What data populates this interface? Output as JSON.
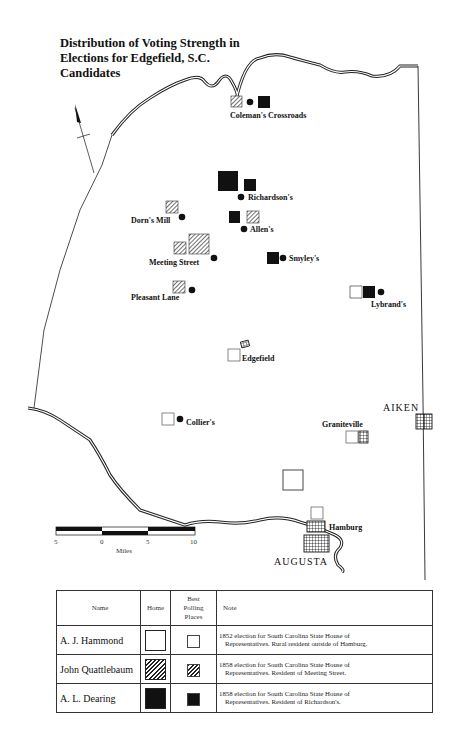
{
  "title": "Distribution of Voting Strength in Elections for Edgefield, S.C. Candidates",
  "title_lines": [
    "Distribution of Voting Strength in",
    "Elections for Edgefield, S.C.",
    "Candidates"
  ],
  "places": [
    {
      "name": "Coleman's Crossroads",
      "markers": [
        "hatch-small",
        "dot",
        "solid-small"
      ]
    },
    {
      "name": "Richardson's",
      "markers": [
        "solid-large",
        "solid-small",
        "dot"
      ]
    },
    {
      "name": "Dorn's Mill",
      "markers": [
        "hatch-small",
        "dot"
      ]
    },
    {
      "name": "Allen's",
      "markers": [
        "solid-small",
        "hatch-small",
        "dot"
      ]
    },
    {
      "name": "Meeting Street",
      "markers": [
        "hatch-small",
        "hatch-large",
        "dot"
      ]
    },
    {
      "name": "Smyley's",
      "markers": [
        "solid-small",
        "dot"
      ]
    },
    {
      "name": "Pleasant Lane",
      "markers": [
        "hatch-small",
        "dot"
      ]
    },
    {
      "name": "Lybrand's",
      "markers": [
        "empty-small",
        "solid-small",
        "dot"
      ]
    },
    {
      "name": "Edgefield",
      "markers": [
        "town-grid",
        "empty-small"
      ]
    },
    {
      "name": "Collier's",
      "markers": [
        "empty-small",
        "dot"
      ]
    },
    {
      "name": "Graniteville",
      "markers": [
        "empty-small",
        "town-grid"
      ]
    },
    {
      "name": "Hamburg",
      "markers": [
        "empty-small",
        "town-grid"
      ]
    },
    {
      "name": "Rural (outside Hamburg)",
      "markers": [
        "empty-large"
      ]
    }
  ],
  "cities": {
    "aiken": "AIKEN",
    "augusta": "AUGUSTA"
  },
  "labels": {
    "colemans": "Coleman's Crossroads",
    "richardsons": "Richardson's",
    "dorns_mill": "Dorn's Mill",
    "allens": "Allen's",
    "meeting_street": "Meeting  Street",
    "smyleys": "Smyley's",
    "pleasant_lane": "Pleasant  Lane",
    "lybrands": "Lybrand's",
    "edgefield": "Edgefield",
    "colliers": "Collier's",
    "graniteville": "Graniteville",
    "hamburg": "Hamburg"
  },
  "scale": {
    "ticks": [
      "5",
      "0",
      "5",
      "10"
    ],
    "unit": "Miles"
  },
  "legend": {
    "headers": {
      "name": "Name",
      "home": "Home",
      "polling": "Best Polling Places",
      "polling_lines": [
        "Best",
        "Polling",
        "Places"
      ],
      "note": "Note"
    },
    "rows": [
      {
        "name": "A. J. Hammond",
        "symbol": "empty",
        "note_line1": "1852 election for South Carolina State House of",
        "note_line2": "Representatives. Rural resident outside of Hamburg."
      },
      {
        "name": "John Quattlebaum",
        "symbol": "hatch",
        "note_line1": "1858 election for South Carolina State House of",
        "note_line2": "Representatives. Resident of Meeting Street."
      },
      {
        "name": "A. L. Dearing",
        "symbol": "solid",
        "note_line1": "1858 election for South Carolina State House of",
        "note_line2": "Representatives. Resident of Richardson's."
      }
    ]
  }
}
